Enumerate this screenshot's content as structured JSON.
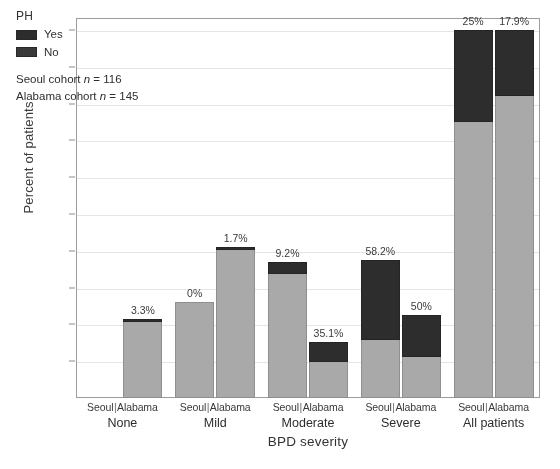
{
  "chart_data": {
    "type": "bar",
    "title": "",
    "xlabel": "BPD severity",
    "ylabel": "Percent of patients",
    "ylim": [
      0,
      105
    ],
    "ytick_labels": [
      "10%",
      "20%",
      "30%",
      "40%",
      "50%",
      "60%",
      "70%",
      "80%",
      "90%",
      "100%"
    ],
    "ytick_values": [
      10,
      20,
      30,
      40,
      50,
      60,
      70,
      80,
      90,
      100
    ],
    "grid": true,
    "legend_position": "top-left",
    "legend_title": "PH",
    "series": [
      {
        "name": "Yes",
        "color": "#2f2f2f"
      },
      {
        "name": "No",
        "color": "#a8a8a8"
      }
    ],
    "categories": [
      "None",
      "Mild",
      "Moderate",
      "Severe",
      "All patients"
    ],
    "cohorts": [
      "Seoul",
      "Alabama"
    ],
    "bars": [
      {
        "group": "None",
        "cohort": "Seoul",
        "total": 0,
        "ph_yes_pct": null,
        "label": ""
      },
      {
        "group": "None",
        "cohort": "Alabama",
        "total": 21.5,
        "ph_yes_pct": 3.3,
        "label": "3.3%"
      },
      {
        "group": "Mild",
        "cohort": "Seoul",
        "total": 26.0,
        "ph_yes_pct": 0,
        "label": "0%"
      },
      {
        "group": "Mild",
        "cohort": "Alabama",
        "total": 41.0,
        "ph_yes_pct": 1.7,
        "label": "1.7%"
      },
      {
        "group": "Moderate",
        "cohort": "Seoul",
        "total": 37.0,
        "ph_yes_pct": 9.2,
        "label": "9.2%"
      },
      {
        "group": "Moderate",
        "cohort": "Alabama",
        "total": 15.2,
        "ph_yes_pct": 35.1,
        "label": "35.1%"
      },
      {
        "group": "Severe",
        "cohort": "Seoul",
        "total": 37.5,
        "ph_yes_pct": 58.2,
        "label": "58.2%"
      },
      {
        "group": "Severe",
        "cohort": "Alabama",
        "total": 22.5,
        "ph_yes_pct": 50,
        "label": "50%"
      },
      {
        "group": "All patients",
        "cohort": "Seoul",
        "total": 100,
        "ph_yes_pct": 25,
        "label": "25%"
      },
      {
        "group": "All patients",
        "cohort": "Alabama",
        "total": 100,
        "ph_yes_pct": 17.9,
        "label": "17.9%"
      }
    ],
    "annotations": [
      "Seoul cohort n = 116",
      "Alabama cohort n = 145"
    ]
  },
  "legend": {
    "title": "PH",
    "items": [
      {
        "label": "Yes",
        "color": "#2f2f2f"
      },
      {
        "label": "No",
        "color": "#a8a8a8"
      }
    ],
    "note_seoul_prefix": "Seoul cohort ",
    "note_seoul_n": "n",
    "note_seoul_value": " = 116",
    "note_alabama_prefix": "Alabama cohort ",
    "note_alabama_n": "n",
    "note_alabama_value": " = 145"
  },
  "axes": {
    "ylabel": "Percent of patients",
    "xlabel": "BPD severity"
  },
  "xgroups": [
    {
      "name": "None",
      "left": "Seoul",
      "right": "Alabama"
    },
    {
      "name": "Mild",
      "left": "Seoul",
      "right": "Alabama"
    },
    {
      "name": "Moderate",
      "left": "Seoul",
      "right": "Alabama"
    },
    {
      "name": "Severe",
      "left": "Seoul",
      "right": "Alabama"
    },
    {
      "name": "All patients",
      "left": "Seoul",
      "right": "Alabama"
    }
  ]
}
